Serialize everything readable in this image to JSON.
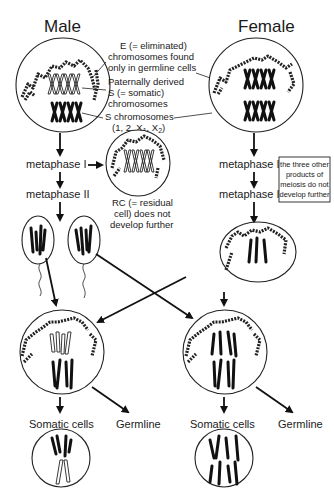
{
  "titles": {
    "male": "Male",
    "female": "Female"
  },
  "annotations": {
    "e_chromosomes": [
      "E (= eliminated)",
      "chromosomes found",
      "only in germline cells"
    ],
    "paternal_s": [
      "Paternally derived",
      "S (= somatic)",
      "chromosomes"
    ],
    "s_chromosomes": [
      "S chromosomes",
      "(1, 2, X",
      "1",
      ", X",
      "2",
      ")"
    ],
    "rc_note": [
      "RC (= residual",
      "cell) does not",
      "develop further"
    ],
    "female_box": [
      "the three other",
      "products of",
      "meiosis do not",
      "develop further"
    ]
  },
  "stages": {
    "male_meta1": "metaphase I",
    "male_meta2": "metaphase II",
    "female_meta1": "metaphase I",
    "female_meta2": "metaphase II"
  },
  "outputs": {
    "male_somatic": "Somatic cells",
    "male_germline": "Germline",
    "female_somatic": "Somatic cells",
    "female_germline": "Germline"
  },
  "colors": {
    "ink": "#111111",
    "background": "#ffffff"
  }
}
